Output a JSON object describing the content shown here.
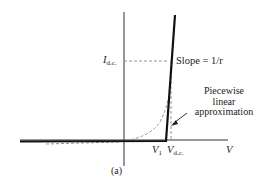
{
  "diagram": {
    "type": "piecewise-linear-diode-characteristic",
    "labels": {
      "y_level": "I",
      "y_level_sub": "d.c.",
      "slope": "Slope = 1/r",
      "annotation_line1": "Piecewise",
      "annotation_line2": "linear",
      "annotation_line3": "approximation",
      "v1": "V",
      "v1_sub": "1",
      "vdc": "V",
      "vdc_sub": "d.c.",
      "x_axis": "V",
      "caption": "(a)"
    },
    "colors": {
      "axis": "#333333",
      "piecewise_line": "#111111",
      "dashed": "#777777"
    }
  }
}
